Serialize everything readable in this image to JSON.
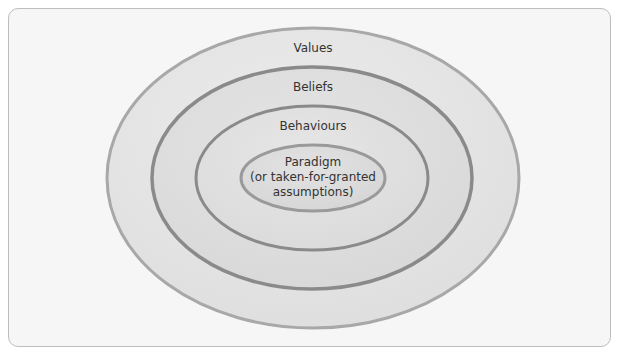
{
  "diagram": {
    "type": "nested-ellipses",
    "layers": [
      {
        "label": "Values",
        "order": 1
      },
      {
        "label": "Beliefs",
        "order": 2
      },
      {
        "label": "Behaviours",
        "order": 3
      },
      {
        "label": "Paradigm (or taken-for-granted assumptions)",
        "order": 4,
        "lines": [
          "Paradigm",
          "(or taken-for-granted",
          "assumptions)"
        ]
      }
    ],
    "colors": {
      "frame_border": "#bdbdbd",
      "background": "#f6f6f6",
      "ring_fill": "#e2e2e2",
      "ring_stroke": "#8a8a8a",
      "text": "#333333"
    }
  }
}
